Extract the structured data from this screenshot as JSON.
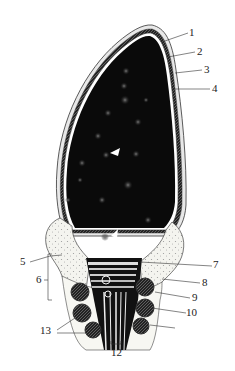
{
  "diagram": {
    "type": "biological cross-section illustration (cnidocyte / nematocyst structure)",
    "labels": [
      {
        "id": "1",
        "text": "1"
      },
      {
        "id": "2",
        "text": "2"
      },
      {
        "id": "3",
        "text": "3"
      },
      {
        "id": "4",
        "text": "4"
      },
      {
        "id": "5",
        "text": "5"
      },
      {
        "id": "6",
        "text": "6"
      },
      {
        "id": "7",
        "text": "7"
      },
      {
        "id": "8",
        "text": "8"
      },
      {
        "id": "9",
        "text": "9"
      },
      {
        "id": "10",
        "text": "10"
      },
      {
        "id": "12",
        "text": "12"
      },
      {
        "id": "13",
        "text": "13"
      }
    ],
    "colors": {
      "background": "#ffffff",
      "body_fill": "#0a0a0a",
      "line": "#222222",
      "stipple_fill": "#f1f1ec"
    }
  }
}
